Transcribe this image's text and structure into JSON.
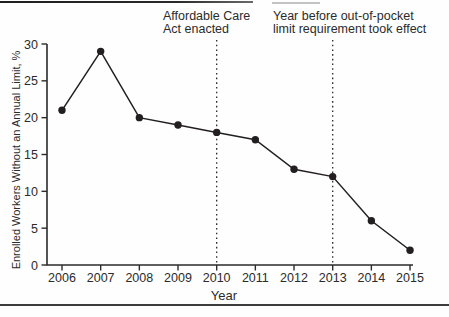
{
  "chart_data": {
    "type": "line",
    "title": "",
    "categories": [
      "2006",
      "2007",
      "2008",
      "2009",
      "2010",
      "2011",
      "2012",
      "2013",
      "2014",
      "2015"
    ],
    "values": [
      21,
      29,
      20,
      19,
      18,
      17,
      13,
      12,
      6,
      2
    ],
    "xlabel": "Year",
    "ylabel": "Enrolled Workers Without an Annual Limit, %",
    "ylim": [
      0,
      30
    ],
    "y_ticks": [
      0,
      5,
      10,
      15,
      20,
      25,
      30
    ],
    "grid": false,
    "legend": "none",
    "marker": "filled-circle",
    "line_color": "#231f20",
    "axis_color": "#2b2b2b",
    "reference_lines": [
      {
        "x": "2010",
        "style": "dotted",
        "label": "Affordable Care\nAct enacted"
      },
      {
        "x": "2013",
        "style": "dotted",
        "label": "Year before out-of-pocket\nlimit requirement took effect"
      }
    ]
  }
}
